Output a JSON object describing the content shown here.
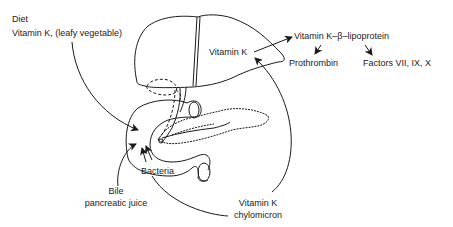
{
  "diagram": {
    "labels": {
      "diet_heading": "Diet",
      "diet_source": "Vitamin K, (leafy vegetable)",
      "liver_vitamin_k": "Vitamin K",
      "lipoprotein": "Vitamin K–β–lipoprotein",
      "prothrombin": "Prothrombin",
      "factors": "Factors VII, IX, X",
      "bile_line1": "Bile",
      "bile_line2": "pancreatic juice",
      "bacteria": "Bacteria",
      "chylomicron_line1": "Vitamin K",
      "chylomicron_line2": "chylomicron"
    },
    "structures": [
      "liver",
      "gallbladder",
      "bile duct",
      "pancreas",
      "duodenum"
    ],
    "colors": {
      "ink": "#1a1a1a",
      "background": "#ffffff"
    }
  }
}
